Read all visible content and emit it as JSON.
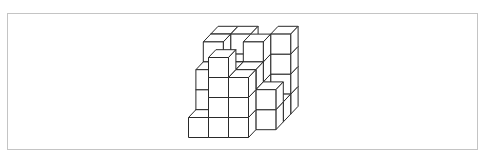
{
  "figure": {
    "type": "isometric-cube-stack",
    "colors": {
      "face_fill": "#ffffff",
      "edge_stroke": "#2a2a2a",
      "frame_border": "#c4c4c4",
      "background": "#ffffff"
    },
    "projection": {
      "origin_x": 188.5,
      "origin_y": 137.5,
      "cube_size": 20,
      "depth_dx": 7.4,
      "depth_dy": -7.8
    },
    "heightmap_note": "rows = columns left-to-right, entries = depth front-to-back, values = stack height",
    "heightmap": [
      [
        1,
        3,
        4,
        4
      ],
      [
        4,
        3,
        3,
        4
      ],
      [
        3,
        3,
        4,
        3
      ],
      [
        0,
        2,
        1,
        4
      ]
    ]
  }
}
